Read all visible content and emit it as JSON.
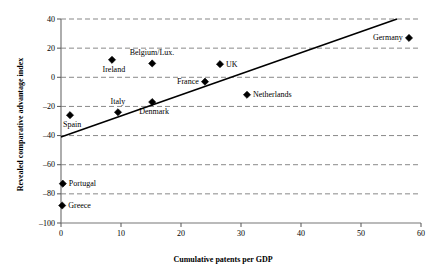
{
  "chart_data": {
    "type": "scatter",
    "title": "",
    "xlabel": "Cumulative patents per GDP",
    "ylabel": "Revealed comparative advantage index",
    "xlim": [
      0,
      60
    ],
    "ylim": [
      -100,
      40
    ],
    "xticks": [
      0,
      10,
      20,
      30,
      40,
      50,
      60
    ],
    "yticks": [
      40,
      20,
      0,
      -20,
      -40,
      -60,
      -80,
      -100
    ],
    "ytick_labels": [
      "40",
      "20",
      "0",
      "–20",
      "–40",
      "–60",
      "–80",
      "–100"
    ],
    "xtick_labels": [
      "0",
      "10",
      "20",
      "30",
      "40",
      "50",
      "60"
    ],
    "grid": "horizontal-dashed",
    "legend": "none",
    "marker": "diamond",
    "marker_color": "#000000",
    "line_color": "#000000",
    "points": [
      {
        "label": "Germany",
        "x": 58.0,
        "y": 27,
        "label_pos": "left"
      },
      {
        "label": "Netherlands",
        "x": 31.0,
        "y": -12,
        "label_pos": "right"
      },
      {
        "label": "UK",
        "x": 26.5,
        "y": 9,
        "label_pos": "right"
      },
      {
        "label": "Belgium/Lux.",
        "x": 15.2,
        "y": 9.5,
        "label_pos": "above"
      },
      {
        "label": "Ireland",
        "x": 8.5,
        "y": 12,
        "label_pos": "below"
      },
      {
        "label": "France",
        "x": 24.0,
        "y": -3,
        "label_pos": "left"
      },
      {
        "label": "Denmark",
        "x": 15.2,
        "y": -17,
        "label_pos": "below"
      },
      {
        "label": "Italy",
        "x": 9.5,
        "y": -24,
        "label_pos": "above"
      },
      {
        "label": "Spain",
        "x": 1.5,
        "y": -26,
        "label_pos": "below"
      },
      {
        "label": "Portugal",
        "x": 0.3,
        "y": -73,
        "label_pos": "right"
      },
      {
        "label": "Greece",
        "x": 0.2,
        "y": -88,
        "label_pos": "right"
      }
    ],
    "trendline": {
      "x0": 0,
      "y0": -41,
      "x1": 56,
      "y1": 40
    }
  }
}
